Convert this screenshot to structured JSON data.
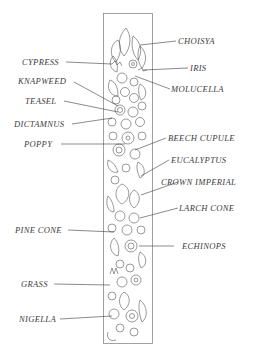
{
  "colors": {
    "ink": "#3c3c3c",
    "frame": "#8a8a8a",
    "paper": "#ffffff"
  },
  "labels": {
    "choisya": "CHOISYA",
    "iris": "IRIS",
    "molucella": "MOLUCELLA",
    "cypress": "CYPRESS",
    "knapweed": "KNAPWEED",
    "teasel": "TEASEL",
    "dictamnus": "DICTAMNUS",
    "poppy": "POPPY",
    "beech_cupule": "BEECH CUPULE",
    "eucalyptus": "EUCALYPTUS",
    "crown_imperial": "CROWN IMPERIAL",
    "larch_cone": "LARCH CONE",
    "pine_cone": "PINE CONE",
    "echinops": "ECHINOPS",
    "grass": "GRASS",
    "nigella": "NIGELLA"
  }
}
